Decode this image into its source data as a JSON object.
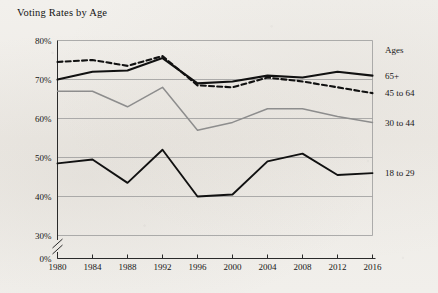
{
  "chart_data": {
    "type": "line",
    "title": "Voting Rates by Age",
    "xlabel": "",
    "ylabel": "",
    "x": [
      1980,
      1984,
      1988,
      1992,
      1996,
      2000,
      2004,
      2008,
      2012,
      2016
    ],
    "categories": [
      "1980",
      "1984",
      "1988",
      "1992",
      "1996",
      "2000",
      "2004",
      "2008",
      "2012",
      "2016"
    ],
    "xtick_labels": [
      "1980",
      "1984",
      "1988",
      "1992",
      "1996",
      "2000",
      "2004",
      "2008",
      "2012",
      "2016"
    ],
    "ytick_labels": [
      "0%",
      "30%",
      "40%",
      "50%",
      "60%",
      "70%",
      "80%"
    ],
    "ylim": [
      30,
      80
    ],
    "ylim_note": "0%",
    "axis_break": true,
    "grid": "horizontal",
    "legend_position": "right",
    "legend_title": "Ages",
    "series": [
      {
        "name": "65+",
        "style": "solid-thick",
        "color": "#111111",
        "values": [
          70.0,
          72.0,
          72.3,
          75.5,
          69.0,
          69.5,
          71.0,
          70.5,
          72.0,
          71.0
        ]
      },
      {
        "name": "45 to 64",
        "style": "dashed",
        "color": "#111111",
        "values": [
          74.5,
          75.0,
          73.5,
          76.0,
          68.5,
          68.0,
          70.5,
          69.5,
          68.0,
          66.5
        ]
      },
      {
        "name": "30 to 44",
        "style": "solid-gray",
        "color": "#8d8d8d",
        "values": [
          67.0,
          67.0,
          63.0,
          68.0,
          57.0,
          59.0,
          62.5,
          62.5,
          60.5,
          59.0
        ]
      },
      {
        "name": "18 to 29",
        "style": "solid",
        "color": "#111111",
        "values": [
          48.5,
          49.5,
          43.5,
          52.0,
          40.0,
          40.5,
          49.0,
          51.0,
          45.5,
          46.0
        ]
      }
    ]
  },
  "legend": {
    "title": "Ages",
    "entries": [
      {
        "label": "65+"
      },
      {
        "label": "45 to 64"
      },
      {
        "label": "30 to 44"
      },
      {
        "label": "18 to 29"
      }
    ]
  },
  "axes": {
    "y_labels": [
      "80%",
      "70%",
      "60%",
      "50%",
      "40%",
      "30%",
      "0%"
    ],
    "x_labels": [
      "1980",
      "1984",
      "1988",
      "1992",
      "1996",
      "2000",
      "2004",
      "2008",
      "2012",
      "2016"
    ]
  }
}
